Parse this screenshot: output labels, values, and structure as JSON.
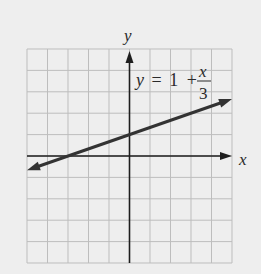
{
  "chart_data": {
    "type": "line",
    "title": "",
    "equation": "y = 1 + x/3",
    "equation_parts": {
      "lhs": "y",
      "eq": "=",
      "const": "1",
      "plus": "+",
      "num": "x",
      "den": "3"
    },
    "xlabel": "x",
    "ylabel": "y",
    "xlim": [
      -5,
      5
    ],
    "ylim": [
      -5,
      5
    ],
    "grid": true,
    "grid_step": 1,
    "series": [
      {
        "name": "y = 1 + x/3",
        "slope": 0.3333,
        "intercept": 1,
        "x": [
          -5,
          -3,
          0,
          3,
          5
        ],
        "y": [
          -0.667,
          0,
          1,
          2,
          2.667
        ],
        "arrows": "both"
      }
    ],
    "key_points": {
      "x_intercept": [
        -3,
        0
      ],
      "y_intercept": [
        0,
        1
      ]
    }
  },
  "colors": {
    "background": "#eeeeee",
    "grid": "#bdbdbd",
    "axis": "#1e1e1e",
    "line": "#333333"
  }
}
